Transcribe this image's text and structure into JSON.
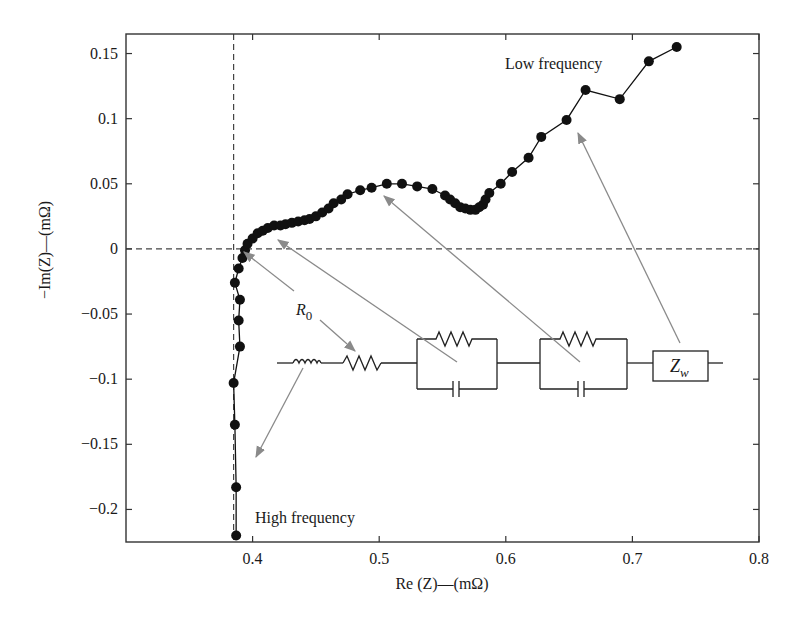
{
  "chart_data": {
    "type": "scatter",
    "title": "",
    "xlabel": "Re (Z)—(mΩ)",
    "ylabel": "−Im(Z)—(mΩ)",
    "xlim": [
      0.3,
      0.8
    ],
    "ylim": [
      -0.225,
      0.165
    ],
    "xticks": [
      0.4,
      0.5,
      0.6,
      0.7,
      0.8
    ],
    "xtick_labels": [
      "0.4",
      "0.5",
      "0.6",
      "0.7",
      "0.8"
    ],
    "yticks": [
      0.15,
      0.1,
      0.05,
      0,
      -0.05,
      -0.1,
      -0.15,
      -0.2
    ],
    "ytick_labels": [
      "0.15",
      "0.1",
      "0.05",
      "0",
      "−0.05",
      "−0.1",
      "−0.15",
      "−0.2"
    ],
    "grid": false,
    "legend": null,
    "reference_lines": {
      "horizontal_dashed_y": 0,
      "vertical_dashed_x": 0.385
    },
    "series": [
      {
        "name": "Impedance spectrum (Nyquist)",
        "marker": "filled-circle",
        "line": "solid",
        "color": "#111111",
        "x": [
          0.387,
          0.387,
          0.386,
          0.385,
          0.39,
          0.389,
          0.39,
          0.386,
          0.389,
          0.392,
          0.394,
          0.396,
          0.4,
          0.404,
          0.408,
          0.412,
          0.417,
          0.422,
          0.426,
          0.431,
          0.436,
          0.441,
          0.445,
          0.45,
          0.455,
          0.46,
          0.464,
          0.47,
          0.475,
          0.485,
          0.494,
          0.506,
          0.518,
          0.53,
          0.542,
          0.552,
          0.556,
          0.56,
          0.564,
          0.568,
          0.572,
          0.576,
          0.579,
          0.582,
          0.584,
          0.587,
          0.596,
          0.605,
          0.618,
          0.628,
          0.648,
          0.663,
          0.69,
          0.713,
          0.735
        ],
        "y": [
          -0.22,
          -0.183,
          -0.135,
          -0.103,
          -0.075,
          -0.055,
          -0.039,
          -0.026,
          -0.015,
          -0.007,
          -0.001,
          0.004,
          0.008,
          0.012,
          0.014,
          0.016,
          0.018,
          0.018,
          0.019,
          0.02,
          0.021,
          0.022,
          0.023,
          0.025,
          0.028,
          0.031,
          0.035,
          0.038,
          0.042,
          0.045,
          0.047,
          0.05,
          0.05,
          0.048,
          0.046,
          0.041,
          0.038,
          0.035,
          0.032,
          0.031,
          0.03,
          0.03,
          0.032,
          0.034,
          0.038,
          0.043,
          0.05,
          0.059,
          0.07,
          0.086,
          0.099,
          0.122,
          0.115,
          0.144,
          0.155
        ]
      }
    ],
    "annotations": [
      {
        "text": "Low frequency",
        "x": 0.6,
        "y": 0.147
      },
      {
        "text": "High frequency",
        "x": 0.403,
        "y": -0.21
      },
      {
        "text": "R",
        "subscript": "0",
        "x": 0.457,
        "y": -0.048
      }
    ],
    "inset_circuit": {
      "description": "Equivalent circuit: inductor – resistor R0 – (R || C) – (R || C) – Warburg Zw in series",
      "elements": [
        "inductor",
        "resistor-R0",
        "rc-parallel-1",
        "rc-parallel-2",
        "warburg-Zw"
      ],
      "warburg_label": "Z",
      "warburg_subscript": "w"
    },
    "arrows": [
      {
        "from_element": "resistor-R0 label",
        "to": [
          0.392,
          0.0
        ]
      },
      {
        "from_element": "R0 label",
        "to": "resistor-R0"
      },
      {
        "from_element": "rc-parallel-1",
        "to": [
          0.423,
          0.007
        ]
      },
      {
        "from_element": "rc-parallel-2",
        "to": [
          0.505,
          0.041
        ]
      },
      {
        "from_element": "warburg-Zw",
        "to": [
          0.657,
          0.09
        ]
      },
      {
        "from_element": "inductor",
        "to": [
          0.405,
          -0.16
        ]
      }
    ]
  },
  "labels": {
    "low_frequency": "Low frequency",
    "high_frequency": "High frequency",
    "r0_main": "R",
    "r0_sub": "0",
    "zw_main": "Z",
    "zw_sub": "w",
    "xlabel": "Re (Z)—(mΩ)",
    "ylabel": "−Im(Z)—(mΩ)"
  },
  "colors": {
    "ink": "#111111",
    "axis": "#333333",
    "arrow": "#8a8a8a",
    "dash": "#444444",
    "background": "#ffffff"
  }
}
